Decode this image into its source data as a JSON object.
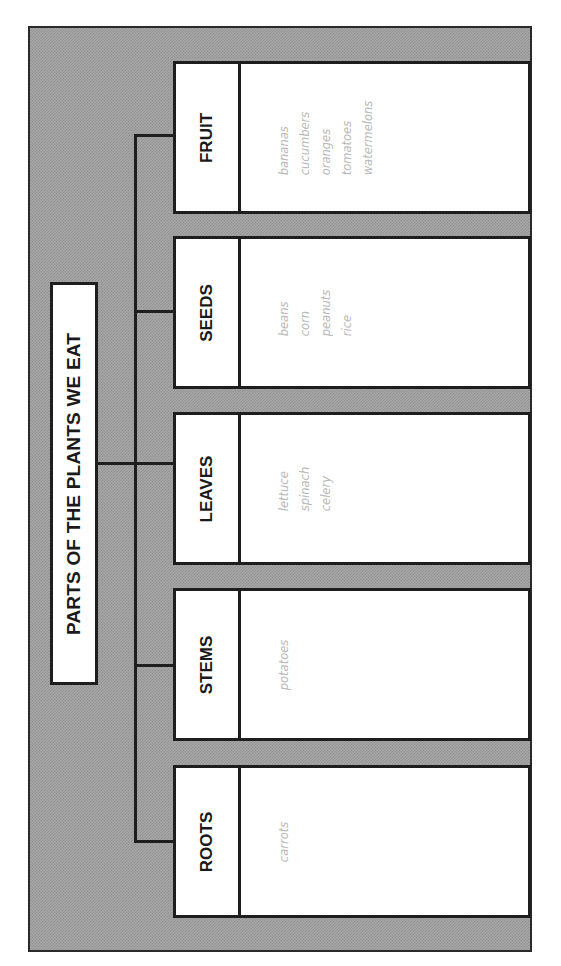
{
  "diagram": {
    "title": "PARTS OF THE PLANTS WE EAT",
    "categories": [
      {
        "label": "FRUIT",
        "items": [
          "bananas",
          "cucumbers",
          "oranges",
          "tomatoes",
          "watermelons"
        ]
      },
      {
        "label": "SEEDS",
        "items": [
          "beans",
          "corn",
          "peanuts",
          "rice"
        ]
      },
      {
        "label": "LEAVES",
        "items": [
          "lettuce",
          "spinach",
          "celery"
        ]
      },
      {
        "label": "STEMS",
        "items": [
          "potatoes"
        ]
      },
      {
        "label": "ROOTS",
        "items": [
          "carrots"
        ]
      }
    ]
  },
  "colors": {
    "frame_fill": "#a8a8a8",
    "line": "#1e1e1e",
    "box_fill": "#ffffff",
    "item_text": "#b8b8b8"
  }
}
